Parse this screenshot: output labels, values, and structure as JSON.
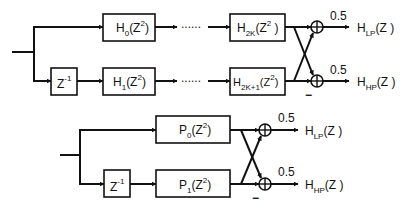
{
  "diagrams": [
    {
      "name": "polyphase-k-stage",
      "delay": {
        "base": "Z",
        "exp": "-1"
      },
      "filters": [
        {
          "base": "H",
          "sub": "0",
          "arg": "(Z",
          "argexp": "2",
          "close": ")"
        },
        {
          "base": "H",
          "sub": "1",
          "arg": "(Z",
          "argexp": "2",
          "close": ")"
        },
        {
          "base": "H",
          "sub": "2K",
          "arg": "(Z",
          "argexp": "2",
          "close": " )"
        },
        {
          "base": "H",
          "sub": "2K+1",
          "arg": "(Z",
          "argexp": "2",
          "close": ")"
        }
      ],
      "dots": "......",
      "gains": [
        "0.5",
        "0.5"
      ],
      "minus": "−",
      "outputs": [
        {
          "base": "H",
          "sub": "LP",
          "arg": "(Z )"
        },
        {
          "base": "H",
          "sub": "HP",
          "arg": "(Z )"
        }
      ]
    },
    {
      "name": "polyphase-single-stage",
      "delay": {
        "base": "Z",
        "exp": "-1"
      },
      "filters": [
        {
          "base": "P",
          "sub": "0",
          "arg": "(Z",
          "argexp": "2",
          "close": ")"
        },
        {
          "base": "P",
          "sub": "1",
          "arg": "(Z",
          "argexp": "2",
          "close": ")"
        }
      ],
      "gains": [
        "0.5",
        "0.5"
      ],
      "minus": "−",
      "outputs": [
        {
          "base": "H",
          "sub": "LP",
          "arg": "(Z )"
        },
        {
          "base": "H",
          "sub": "HP",
          "arg": "(Z )"
        }
      ]
    }
  ]
}
